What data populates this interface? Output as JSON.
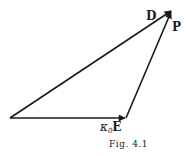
{
  "figure": {
    "caption": "Fig. 4.1",
    "stroke_color": "#1a1a1a",
    "vectors": [
      {
        "name": "D",
        "from": [
          10,
          118
        ],
        "to": [
          172,
          10
        ],
        "label": "D"
      },
      {
        "name": "kappa0E",
        "from": [
          10,
          118
        ],
        "to": [
          126,
          118
        ],
        "label_symbol": "κ",
        "label_sub": "0",
        "label_letter": "E"
      },
      {
        "name": "P",
        "from": [
          126,
          118
        ],
        "to": [
          172,
          10
        ],
        "label": "P"
      }
    ],
    "labels": {
      "D": "D",
      "P": "P",
      "kappa": "κ",
      "kappa_sub": "0",
      "E": "E"
    }
  }
}
